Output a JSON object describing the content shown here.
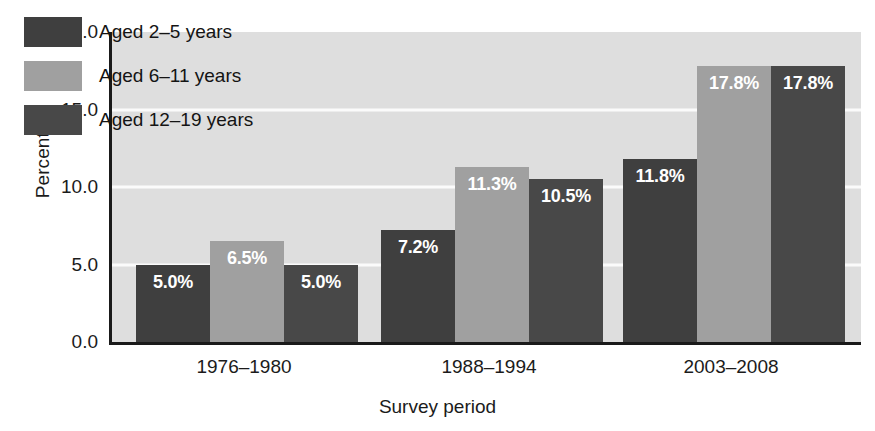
{
  "chart_data": {
    "type": "bar",
    "title": "",
    "subtitle": "",
    "xlabel": "Survey period",
    "ylabel": "Percent %",
    "categories": [
      "1976–1980",
      "1988–1994",
      "2003–2008"
    ],
    "series": [
      {
        "name": "Aged 2–5 years",
        "color": "#3f3f3f",
        "values": [
          5.0,
          7.2,
          11.8
        ],
        "labels": [
          "5.0%",
          "7.2%",
          "11.8%"
        ]
      },
      {
        "name": "Aged 6–11 years",
        "color": "#a0a0a0",
        "values": [
          6.5,
          11.3,
          17.8
        ],
        "labels": [
          "6.5%",
          "11.3%",
          "17.8%"
        ]
      },
      {
        "name": "Aged 12–19 years",
        "color": "#484848",
        "values": [
          5.0,
          10.5,
          17.8
        ],
        "labels": [
          "5.0%",
          "10.5%",
          "17.8%"
        ]
      }
    ],
    "ylim": [
      0.0,
      20.0
    ],
    "yticks": [
      0.0,
      5.0,
      10.0,
      15.0,
      20.0
    ],
    "ytick_labels": [
      "0.0",
      "5.0",
      "10.0",
      "15.0",
      "20.0"
    ],
    "grid": true,
    "gridlines_at": [
      5.0,
      10.0,
      15.0
    ],
    "legend_position": "upper-left-inside",
    "plot_background": "#dedede",
    "gridline_color": "#fbfbfb",
    "axis_color": "#1a1a1a",
    "value_label_color": "#ffffff",
    "figure_background": "#ffffff"
  },
  "legend": {
    "items": [
      {
        "label": "Aged 2–5 years",
        "color": "#3f3f3f"
      },
      {
        "label": "Aged 6–11 years",
        "color": "#a0a0a0"
      },
      {
        "label": "Aged 12–19 years",
        "color": "#484848"
      }
    ]
  },
  "axes": {
    "y": {
      "title": "Percent %",
      "ticks": [
        "20.0",
        "15.0",
        "10.0",
        "5.0",
        "0.0"
      ]
    },
    "x": {
      "title": "Survey period",
      "ticks": [
        "1976–1980",
        "1988–1994",
        "2003–2008"
      ]
    }
  }
}
